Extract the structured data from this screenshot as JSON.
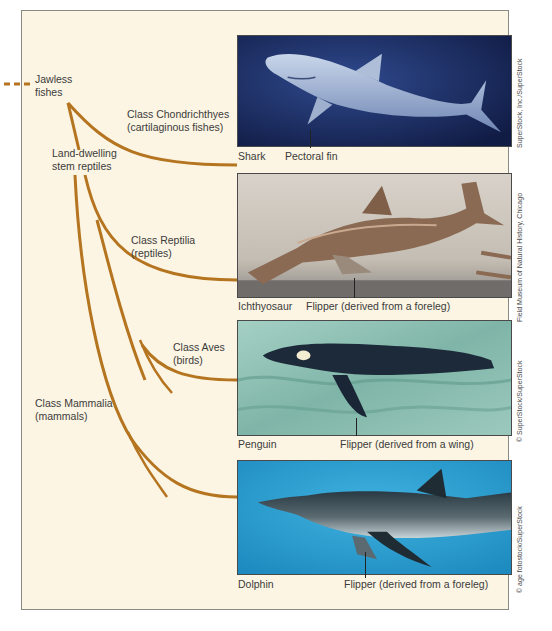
{
  "figure": {
    "type": "evolutionary-tree-convergent-evolution",
    "colors": {
      "background": "#fcf5e3",
      "branch": "#b5741f",
      "frame_border": "#8a8a84",
      "text": "#3b3b3b"
    }
  },
  "tree": {
    "root_label": "Jawless\nfishes",
    "root_label_lines": [
      "Jawless",
      "fishes"
    ],
    "stem_label_lines": [
      "Land-dwelling",
      "stem reptiles"
    ],
    "branches": [
      {
        "class_label": "Class Chondrichthyes",
        "common_label": "(cartilaginous fishes)"
      },
      {
        "class_label": "Class Reptilia",
        "common_label": "(reptiles)"
      },
      {
        "class_label": "Class Aves",
        "common_label": "(birds)"
      },
      {
        "class_label": "Class Mammalia",
        "common_label": "(mammals)"
      }
    ]
  },
  "panels": [
    {
      "animal": "Shark",
      "structure": "Pectoral fin",
      "credit": "SuperStock, Inc./SuperStock",
      "bg_color": "#1a2a5e"
    },
    {
      "animal": "Ichthyosaur",
      "structure": "Flipper (derived from a foreleg)",
      "credit": "Field Museum of Natural History, Chicago",
      "bg_color": "#c9c2b8"
    },
    {
      "animal": "Penguin",
      "structure": "Flipper (derived from a wing)",
      "credit": "© SuperStock/SuperStock",
      "bg_color": "#8fc1b4"
    },
    {
      "animal": "Dolphin",
      "structure": "Flipper (derived from a foreleg)",
      "credit": "© age fotostock/SuperStock",
      "bg_color": "#2a9ccc"
    }
  ]
}
